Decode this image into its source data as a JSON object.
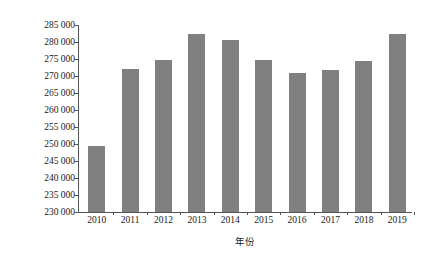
{
  "chart_data": {
    "type": "bar",
    "title": "",
    "subtitle": "",
    "xlabel": "年份",
    "ylabel": "煤炭消费总量/万 t 标准煤",
    "categories": [
      "2010",
      "2011",
      "2012",
      "2013",
      "2014",
      "2015",
      "2016",
      "2017",
      "2018",
      "2019"
    ],
    "values": [
      249400,
      272000,
      274700,
      282400,
      280600,
      274700,
      270900,
      271700,
      274400,
      282400
    ],
    "series": [
      {
        "name": "煤炭消费总量",
        "values": [
          249400,
          272000,
          274700,
          282400,
          280600,
          274700,
          270900,
          271700,
          274400,
          282400
        ]
      }
    ],
    "ylim": [
      230000,
      285000
    ],
    "ytick_values": [
      230000,
      235000,
      240000,
      245000,
      250000,
      255000,
      260000,
      265000,
      270000,
      275000,
      280000,
      285000
    ],
    "ytick_labels": [
      "230 000",
      "235 000",
      "240 000",
      "245 000",
      "250 000",
      "255 000",
      "260 000",
      "265 000",
      "270 000",
      "275 000",
      "280 000",
      "285 000"
    ],
    "ytick_step": 5000,
    "grid": false,
    "legend": false,
    "legend_position": "none",
    "bar_color": "#808080",
    "axis_color": "#555555",
    "background_color": "#ffffff"
  }
}
